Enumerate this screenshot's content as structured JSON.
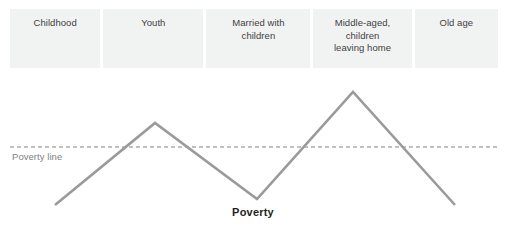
{
  "figure": {
    "width": 506,
    "height": 237,
    "background_color": "#ffffff"
  },
  "stages": {
    "cell_background": "#f1f2f2",
    "text_color": "#414042",
    "items": [
      {
        "label": "Childhood",
        "width": 92
      },
      {
        "label": "Youth",
        "width": 102
      },
      {
        "label": "Married with\nchildren",
        "width": 106
      },
      {
        "label": "Middle-aged,\nchildren\nleaving home",
        "width": 100
      },
      {
        "label": "Old age",
        "width": 85
      }
    ]
  },
  "poverty_line": {
    "label": "Poverty line",
    "label_color": "#808285",
    "stroke_color": "#808285",
    "dash_pattern": "4,3",
    "y": 79,
    "x_start": 10,
    "x_end": 498
  },
  "caption": {
    "text": "Poverty",
    "color": "#231f20"
  },
  "chart_data": {
    "type": "line",
    "title": "Poverty",
    "xlabel": "",
    "ylabel": "Poverty",
    "grid": false,
    "legend": null,
    "series": [
      {
        "name": "Poverty level over the life cycle",
        "stroke_color": "#9a9a9a",
        "stroke_width": 2.6,
        "points": [
          {
            "x": 55,
            "y": 137,
            "stage": "Childhood",
            "note": "start, below poverty line"
          },
          {
            "x": 155,
            "y": 55,
            "stage": "Youth",
            "note": "first peak, above poverty line"
          },
          {
            "x": 257,
            "y": 131,
            "stage": "Married with children",
            "note": "trough, below poverty line"
          },
          {
            "x": 353,
            "y": 24,
            "stage": "Middle-aged, children leaving home",
            "note": "second peak, highest point"
          },
          {
            "x": 455,
            "y": 137,
            "stage": "Old age",
            "note": "end, below poverty line"
          }
        ]
      }
    ],
    "annotations": [
      {
        "text": "Poverty line",
        "type": "horizontal-threshold",
        "y": 79
      }
    ]
  }
}
